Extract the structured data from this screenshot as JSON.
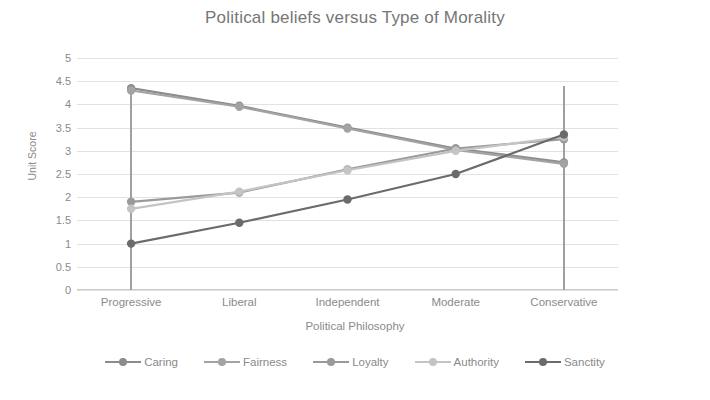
{
  "chart_data": {
    "type": "line",
    "title": "Political beliefs versus Type of Morality",
    "xlabel": "Political Philosophy",
    "ylabel": "Unit Score",
    "categories": [
      "Progressive",
      "Liberal",
      "Independent",
      "Moderate",
      "Conservative"
    ],
    "ylim": [
      0,
      5
    ],
    "ytick_step": 0.5,
    "yticks": [
      "5",
      "4.5",
      "4",
      "3.5",
      "3",
      "2.5",
      "2",
      "1.5",
      "1",
      "0.5",
      "0"
    ],
    "grid": true,
    "legend_position": "bottom",
    "series": [
      {
        "name": "Caring",
        "values": [
          4.35,
          3.97,
          3.5,
          3.05,
          2.75
        ],
        "color": "#8c8c8c"
      },
      {
        "name": "Fairness",
        "values": [
          4.3,
          3.95,
          3.48,
          3.02,
          2.72
        ],
        "color": "#a3a3a3"
      },
      {
        "name": "Loyalty",
        "values": [
          1.9,
          2.1,
          2.6,
          3.05,
          3.25
        ],
        "color": "#9a9a9a"
      },
      {
        "name": "Authority",
        "values": [
          1.75,
          2.12,
          2.58,
          3.0,
          3.3
        ],
        "color": "#c4c4c4"
      },
      {
        "name": "Sanctity",
        "values": [
          1.0,
          1.45,
          1.95,
          2.5,
          3.35
        ],
        "color": "#6b6b6b"
      }
    ],
    "annotations": {
      "vertical_markers": [
        {
          "category": "Progressive",
          "color": "#a0a0a0"
        },
        {
          "category": "Conservative",
          "color": "#a0a0a0"
        }
      ]
    }
  }
}
